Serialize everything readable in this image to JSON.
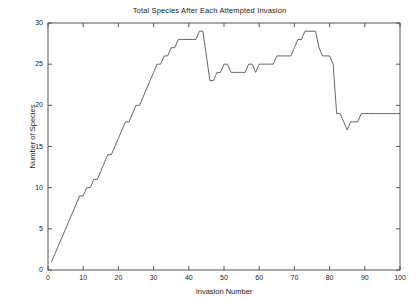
{
  "chart_data": {
    "type": "line",
    "title": "Total Species After Each Attempted Invasion",
    "xlabel": "Invasion Number",
    "ylabel": "Number of Species",
    "xlim": [
      0,
      100
    ],
    "ylim": [
      0,
      30
    ],
    "xticks": [
      0,
      10,
      20,
      30,
      40,
      50,
      60,
      70,
      80,
      90,
      100
    ],
    "yticks": [
      0,
      5,
      10,
      15,
      20,
      25,
      30
    ],
    "grid": false,
    "legend": null,
    "line_color": "#555555",
    "series": [
      {
        "name": "Total Species",
        "x": [
          1,
          2,
          3,
          4,
          5,
          6,
          7,
          8,
          9,
          10,
          11,
          12,
          13,
          14,
          15,
          16,
          17,
          18,
          19,
          20,
          21,
          22,
          23,
          24,
          25,
          26,
          27,
          28,
          29,
          30,
          31,
          32,
          33,
          34,
          35,
          36,
          37,
          38,
          39,
          40,
          41,
          42,
          43,
          44,
          45,
          46,
          47,
          48,
          49,
          50,
          51,
          52,
          53,
          54,
          55,
          56,
          57,
          58,
          59,
          60,
          61,
          62,
          63,
          64,
          65,
          66,
          67,
          68,
          69,
          70,
          71,
          72,
          73,
          74,
          75,
          76,
          77,
          78,
          79,
          80,
          81,
          82,
          83,
          84,
          85,
          86,
          87,
          88,
          89,
          90,
          91,
          92,
          93,
          94,
          95,
          96,
          97,
          98,
          99,
          100
        ],
        "values": [
          1,
          2,
          3,
          4,
          5,
          6,
          7,
          8,
          9,
          9,
          10,
          10,
          11,
          11,
          12,
          13,
          14,
          14,
          15,
          16,
          17,
          18,
          18,
          19,
          20,
          20,
          21,
          22,
          23,
          24,
          25,
          25,
          26,
          26,
          27,
          27,
          28,
          28,
          28,
          28,
          28,
          28,
          29,
          29,
          26,
          23,
          23,
          24,
          24,
          25,
          25,
          24,
          24,
          24,
          24,
          24,
          25,
          25,
          24,
          25,
          25,
          25,
          25,
          25,
          26,
          26,
          26,
          26,
          26,
          27,
          28,
          28,
          29,
          29,
          29,
          29,
          27,
          26,
          26,
          26,
          25,
          19,
          19,
          18,
          17,
          18,
          18,
          18,
          19,
          19,
          19,
          19,
          19,
          19,
          19,
          19,
          19,
          19,
          19,
          19
        ]
      }
    ]
  },
  "axes": {
    "ytick_labels": [
      "0",
      "5",
      "10",
      "15",
      "20",
      "25",
      "30"
    ],
    "xtick_labels": [
      "0",
      "10",
      "20",
      "30",
      "40",
      "50",
      "60",
      "70",
      "80",
      "90",
      "100"
    ]
  }
}
